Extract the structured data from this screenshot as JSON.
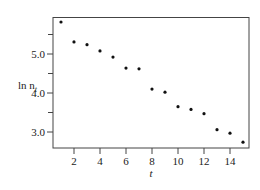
{
  "chart_data": {
    "type": "scatter",
    "title": "",
    "xlabel": "t",
    "ylabel": "ln n",
    "ylabel_subscript": "t",
    "xlim": [
      0.4,
      15.5
    ],
    "ylim": [
      2.6,
      6.0
    ],
    "x_ticks": [
      2,
      4,
      6,
      8,
      10,
      12,
      14
    ],
    "x_tick_labels": [
      "2",
      "4",
      "6",
      "8",
      "10",
      "12",
      "14"
    ],
    "y_major_ticks": [
      3.0,
      4.0,
      5.0
    ],
    "y_tick_labels": [
      "3.0",
      "4.0",
      "5.0"
    ],
    "y_minor_ticks": [
      3.5,
      4.5,
      5.5
    ],
    "grid": false,
    "legend": null,
    "series": [
      {
        "name": "ln n_t",
        "x": [
          1,
          2,
          3,
          4,
          5,
          6,
          7,
          8,
          9,
          10,
          11,
          12,
          13,
          14,
          15
        ],
        "values": [
          5.82,
          5.31,
          5.24,
          5.08,
          4.92,
          4.64,
          4.62,
          4.1,
          4.02,
          3.65,
          3.58,
          3.47,
          3.06,
          2.97,
          2.74
        ]
      }
    ]
  }
}
